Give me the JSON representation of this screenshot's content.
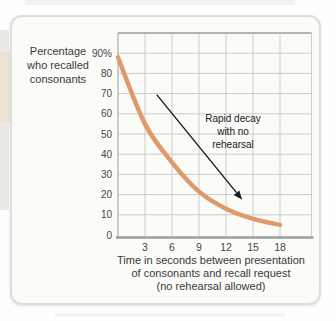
{
  "figure": {
    "ylabel_lines": [
      "Percentage",
      "who recalled",
      "consonants"
    ],
    "xlabel_lines": [
      "Time in seconds between presentation",
      "of consonants and recall request",
      "(no rehearsal allowed)"
    ],
    "annotation_lines": [
      "Rapid decay",
      "with no",
      "rehearsal"
    ]
  },
  "chart_data": {
    "type": "line",
    "x": [
      0,
      3,
      6,
      9,
      12,
      15,
      18
    ],
    "series": [
      {
        "name": "percentage-recalled",
        "values": [
          88,
          55,
          36,
          21.5,
          13,
          8,
          5
        ]
      }
    ],
    "title": "",
    "xlabel": "Time in seconds between presentation of consonants and recall request (no rehearsal allowed)",
    "ylabel": "Percentage who recalled consonants",
    "xlim": [
      0,
      21.5
    ],
    "ylim": [
      0,
      100
    ],
    "xticks": [
      3,
      6,
      9,
      12,
      15,
      18
    ],
    "yticks": [
      {
        "value": 90,
        "label": "90%"
      },
      {
        "value": 80,
        "label": "80"
      },
      {
        "value": 70,
        "label": "70"
      },
      {
        "value": 60,
        "label": "60"
      },
      {
        "value": 50,
        "label": "50"
      },
      {
        "value": 40,
        "label": "40"
      },
      {
        "value": 30,
        "label": "30"
      },
      {
        "value": 20,
        "label": "20"
      },
      {
        "value": 10,
        "label": "10"
      },
      {
        "value": 0,
        "label": "0"
      }
    ],
    "grid": true,
    "legend": "none",
    "annotation": {
      "text": "Rapid decay with no rehearsal",
      "arrow": {
        "from_x": 4.3,
        "from_y": 69.5,
        "to_x": 13.8,
        "to_y": 17.5
      }
    },
    "colors": {
      "line": "#e0996a",
      "grid": "#c9cdcc",
      "axis": "#9aa0a0",
      "tick_text": "#474747",
      "arrow": "#1c1c1c",
      "card_bg": "#fbfbf8",
      "card_border": "#dbded9"
    }
  }
}
